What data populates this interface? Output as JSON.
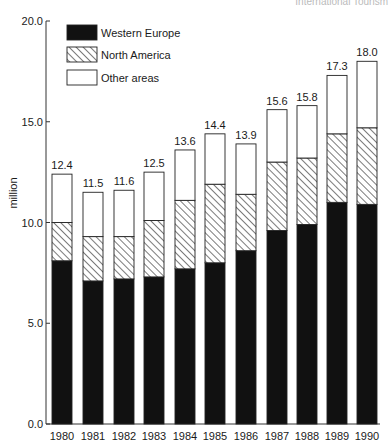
{
  "source_note": "International Tourism",
  "chart_data": {
    "type": "bar",
    "stacked": true,
    "title": "",
    "xlabel": "",
    "ylabel": "million",
    "ylim": [
      0,
      20
    ],
    "yticks": [
      0.0,
      5.0,
      10.0,
      15.0,
      20.0
    ],
    "ytick_labels": [
      "0.0",
      "5.0",
      "10.0",
      "15.0",
      "20.0"
    ],
    "grid": false,
    "legend_position": "top-left",
    "categories": [
      "1980",
      "1981",
      "1982",
      "1983",
      "1984",
      "1985",
      "1986",
      "1987",
      "1988",
      "1989",
      "1990"
    ],
    "series": [
      {
        "name": "Western Europe",
        "pattern": "solid",
        "color": "#111111",
        "values": [
          8.1,
          7.1,
          7.2,
          7.3,
          7.7,
          8.0,
          8.6,
          9.6,
          9.9,
          11.0,
          10.9
        ]
      },
      {
        "name": "North America",
        "pattern": "hatched",
        "color": "#ffffff",
        "values": [
          1.9,
          2.2,
          2.1,
          2.8,
          3.4,
          3.9,
          2.8,
          3.4,
          3.3,
          3.4,
          3.8
        ]
      },
      {
        "name": "Other areas",
        "pattern": "empty",
        "color": "#ffffff",
        "values": [
          2.4,
          2.2,
          2.3,
          2.4,
          2.5,
          2.5,
          2.5,
          2.6,
          2.6,
          2.9,
          3.3
        ]
      }
    ],
    "totals": [
      12.4,
      11.5,
      11.6,
      12.5,
      13.6,
      14.4,
      13.9,
      15.6,
      15.8,
      17.3,
      18.0
    ],
    "total_labels": [
      "12.4",
      "11.5",
      "11.6",
      "12.5",
      "13.6",
      "14.4",
      "13.9",
      "15.6",
      "15.8",
      "17.3",
      "18.0"
    ]
  }
}
